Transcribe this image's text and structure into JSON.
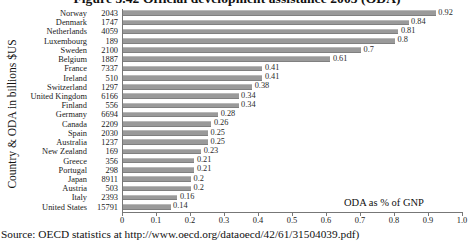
{
  "chart_data": {
    "type": "bar",
    "orientation": "horizontal",
    "title": "Figure 3.42 Official development assistance 2003 (ODA)",
    "xlabel": "ODA as % of GNP",
    "ylabel": "Country & ODA in billions $US",
    "xlim": [
      0,
      1.0
    ],
    "xticks": [
      "0",
      "0.1",
      "0.2",
      "0.3",
      "0.4",
      "0.5",
      "0.6",
      "0.7",
      "0.8",
      "0.9",
      "1.0"
    ],
    "xtick_values": [
      0,
      0.1,
      0.2,
      0.3,
      0.4,
      0.5,
      0.6,
      0.7,
      0.8,
      0.9,
      1.0
    ],
    "grid": false,
    "legend": null,
    "bar_color": "#9a9a9a",
    "categories": [
      "Norway",
      "Denmark",
      "Netherlands",
      "Luxembourg",
      "Sweden",
      "Belgium",
      "France",
      "Ireland",
      "Switzerland",
      "United Kingdom",
      "Finland",
      "Germany",
      "Canada",
      "Spain",
      "Australia",
      "New Zealand",
      "Greece",
      "Portugal",
      "Japan",
      "Austria",
      "Italy",
      "United States"
    ],
    "oda_billions_usd": [
      "2043",
      "1747",
      "4059",
      "189",
      "2100",
      "1887",
      "7337",
      "510",
      "1297",
      "6166",
      "556",
      "6694",
      "2209",
      "2030",
      "1237",
      "169",
      "356",
      "298",
      "8911",
      "503",
      "2393",
      "15791"
    ],
    "values": [
      0.92,
      0.84,
      0.81,
      0.8,
      0.7,
      0.61,
      0.41,
      0.41,
      0.38,
      0.34,
      0.34,
      0.28,
      0.26,
      0.25,
      0.25,
      0.23,
      0.21,
      0.21,
      0.2,
      0.2,
      0.16,
      0.14
    ],
    "value_labels": [
      "0.92",
      "0.84",
      "0.81",
      "0.8",
      "0.7",
      "0.61",
      "0.41",
      "0.41",
      "0.38",
      "0.34",
      "0.34",
      "0.28",
      "0.26",
      "0.25",
      "0.25",
      "0.23",
      "0.21",
      "0.21",
      "0.2",
      "0.2",
      "0.16",
      "0.14"
    ]
  },
  "source": {
    "note": "Source: OECD statistics at http://www.oecd.org/dataoecd/42/61/31504039.pdf)"
  }
}
